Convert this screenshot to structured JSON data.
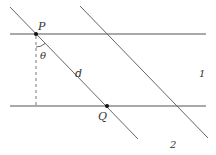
{
  "diagram": {
    "labels": {
      "P": "P",
      "Q": "Q",
      "theta": "θ",
      "d": "d",
      "medium1": "1",
      "medium2": "2"
    },
    "colors": {
      "line": "#555555",
      "dashed": "#777777",
      "point": "#111111",
      "text": "#333333"
    },
    "geometry": {
      "top_line": {
        "x1": 10,
        "y1": 34,
        "x2": 206,
        "y2": 34
      },
      "bottom_line": {
        "x1": 10,
        "y1": 106,
        "x2": 206,
        "y2": 106
      },
      "ray_1": {
        "x1": 10,
        "y1": 7,
        "x2": 138,
        "y2": 139
      },
      "ray_2": {
        "x1": 80,
        "y1": 6,
        "x2": 208,
        "y2": 138
      },
      "perpendicular": {
        "x1": 36,
        "y1": 34,
        "x2": 36,
        "y2": 106
      },
      "point_P": {
        "x": 36,
        "y": 34
      },
      "point_Q": {
        "x": 107,
        "y": 106
      }
    }
  }
}
